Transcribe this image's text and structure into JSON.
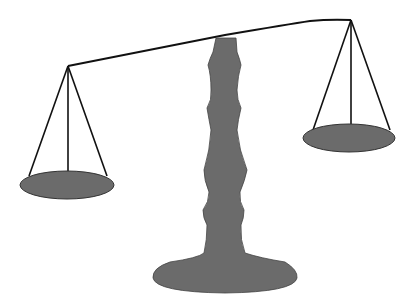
{
  "illustration": {
    "subject": "balance scale",
    "colors": {
      "fill": "#6b6b6b",
      "line": "#111111",
      "background": "#ffffff"
    }
  }
}
